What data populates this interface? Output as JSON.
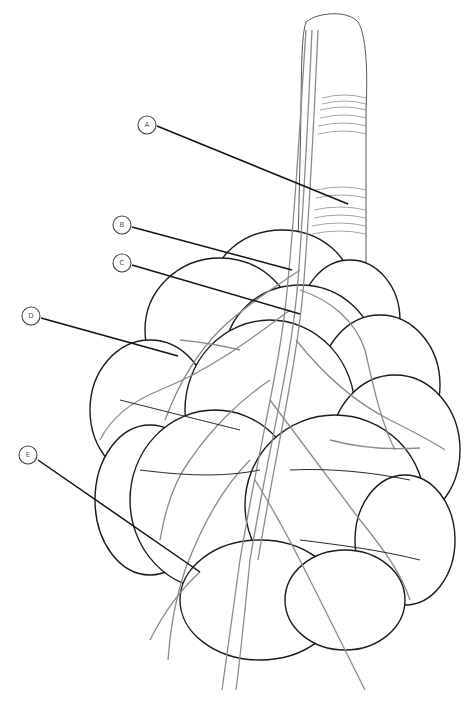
{
  "diagram": {
    "labels": [
      {
        "letter": "A",
        "cx": 147,
        "cy": 125,
        "x2": 348,
        "y2": 204
      },
      {
        "letter": "B",
        "cx": 122,
        "cy": 225,
        "x2": 292,
        "y2": 270
      },
      {
        "letter": "C",
        "cx": 122,
        "cy": 263,
        "x2": 300,
        "y2": 314
      },
      {
        "letter": "D",
        "cx": 31,
        "cy": 316,
        "x2": 178,
        "y2": 356
      },
      {
        "letter": "E",
        "cx": 28,
        "cy": 455,
        "x2": 200,
        "y2": 572
      }
    ],
    "colors": {
      "outline": "#1a1a1a",
      "vessel": "#8a8a8a",
      "background": "#ffffff"
    }
  }
}
